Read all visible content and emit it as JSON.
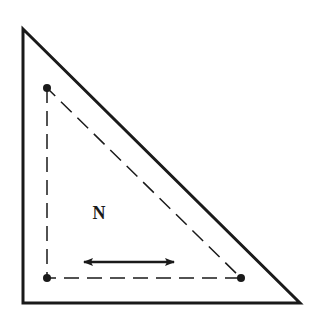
{
  "diagram": {
    "type": "geometric-figure",
    "colors": {
      "background": "#ffffff",
      "stroke": "#1a1a1a",
      "fill": "#1a1a1a"
    },
    "outer_triangle": {
      "vertices": [
        [
          23,
          29
        ],
        [
          23,
          303
        ],
        [
          300,
          303
        ]
      ],
      "stroke_width": 3
    },
    "inner_triangle": {
      "vertices": [
        [
          47,
          88
        ],
        [
          47,
          278
        ],
        [
          241,
          278
        ]
      ],
      "stroke_width": 1.5,
      "dash": "15 8"
    },
    "points": [
      {
        "name": "top-left-point",
        "x": 47,
        "y": 88,
        "r": 4
      },
      {
        "name": "bottom-left-point",
        "x": 47,
        "y": 278,
        "r": 4
      },
      {
        "name": "bottom-right-point",
        "x": 241,
        "y": 278,
        "r": 4
      }
    ],
    "arrow": {
      "x1": 84,
      "y1": 262,
      "x2": 174,
      "y2": 262,
      "stroke_width": 2.5,
      "direction": "double-headed"
    },
    "label": {
      "text": "N",
      "x": 99,
      "y": 219,
      "font_size": 18
    }
  }
}
